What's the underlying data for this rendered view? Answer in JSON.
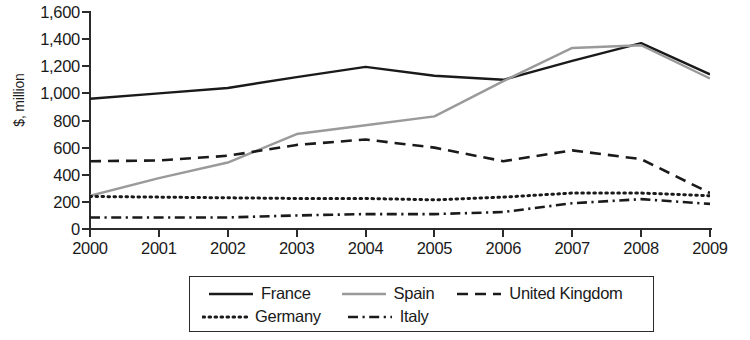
{
  "chart_data": {
    "type": "line",
    "title": "",
    "xlabel": "",
    "ylabel": "$, million",
    "categories": [
      "2000",
      "2001",
      "2002",
      "2003",
      "2004",
      "2005",
      "2006",
      "2007",
      "2008",
      "2009"
    ],
    "x": [
      2000,
      2001,
      2002,
      2003,
      2004,
      2005,
      2006,
      2007,
      2008,
      2009
    ],
    "ylim": [
      0,
      1600
    ],
    "xlim": [
      2000,
      2009
    ],
    "y_ticks": [
      "0",
      "200",
      "400",
      "600",
      "800",
      "1,000",
      "1,200",
      "1,400",
      "1,600"
    ],
    "y_tick_values": [
      0,
      200,
      400,
      600,
      800,
      1000,
      1200,
      1400,
      1600
    ],
    "grid": false,
    "legend_position": "bottom",
    "series": [
      {
        "name": "France",
        "style": "solid",
        "color": "#1a1a1a",
        "values": [
          960,
          1000,
          1040,
          1120,
          1195,
          1130,
          1100,
          1240,
          1370,
          1140
        ]
      },
      {
        "name": "Spain",
        "style": "solid",
        "color": "#9a9a9a",
        "values": [
          245,
          375,
          490,
          700,
          765,
          830,
          1090,
          1335,
          1355,
          1110
        ]
      },
      {
        "name": "United Kingdom",
        "style": "dashed",
        "color": "#1a1a1a",
        "values": [
          500,
          505,
          540,
          620,
          660,
          600,
          500,
          580,
          515,
          265
        ]
      },
      {
        "name": "Germany",
        "style": "dotted",
        "color": "#1a1a1a",
        "values": [
          240,
          235,
          230,
          225,
          225,
          215,
          235,
          265,
          265,
          245
        ]
      },
      {
        "name": "Italy",
        "style": "dashdot",
        "color": "#1a1a1a",
        "values": [
          85,
          85,
          85,
          100,
          110,
          110,
          125,
          190,
          220,
          185
        ]
      }
    ]
  },
  "axes": {
    "y_title": "$, million"
  },
  "legend": {
    "rows": [
      [
        {
          "label": "France",
          "key": "france"
        },
        {
          "label": "Spain",
          "key": "spain"
        },
        {
          "label": "United Kingdom",
          "key": "uk"
        }
      ],
      [
        {
          "label": "Germany",
          "key": "germany"
        },
        {
          "label": "Italy",
          "key": "italy"
        }
      ]
    ],
    "france_label": "France",
    "spain_label": "Spain",
    "uk_label": "United Kingdom",
    "germany_label": "Germany",
    "italy_label": "Italy"
  }
}
